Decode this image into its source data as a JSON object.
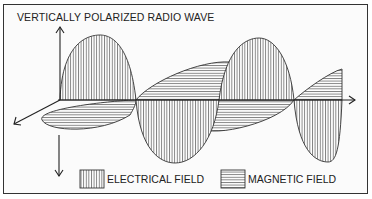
{
  "diagram": {
    "title": "VERTICALLY POLARIZED RADIO WAVE",
    "legend": [
      {
        "label": "ELECTRICAL FIELD",
        "pattern": "vertical-hatch"
      },
      {
        "label": "MAGNETIC FIELD",
        "pattern": "horizontal-hatch"
      }
    ],
    "colors": {
      "line": "#333333",
      "background": "#fbfbfb"
    }
  }
}
